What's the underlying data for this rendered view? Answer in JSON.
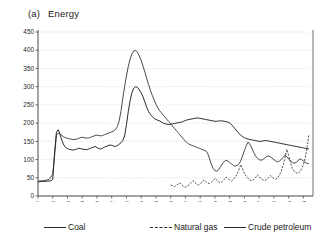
{
  "panel": {
    "tag": "(a)",
    "title": "Energy"
  },
  "legend": {
    "position": "bottom",
    "items": [
      {
        "label": "Coal",
        "style": "solid",
        "key": "coal"
      },
      {
        "label": "Natural gas",
        "style": "dashed",
        "key": "natural_gas"
      },
      {
        "label": "Crude petroleum",
        "style": "solid",
        "key": "crude_petroleum"
      }
    ]
  },
  "axes": {
    "y_ticks": [
      0,
      50,
      100,
      150,
      200,
      250,
      300,
      350,
      400,
      450
    ],
    "x_ticks": [
      1972,
      1974,
      1976,
      1978,
      1980,
      1982,
      1984,
      1986,
      1988,
      1990,
      1992,
      1994,
      1996,
      1998,
      2000,
      2002,
      2004,
      2006,
      2008
    ]
  },
  "colors": {
    "line": "#2b2b2b",
    "grid": "#b9b9b9",
    "axis": "#4a4a4a",
    "background": "#ffffff"
  },
  "chart_data": {
    "type": "line",
    "xlabel": "",
    "ylabel": "",
    "xlim": [
      1972,
      2008.9
    ],
    "ylim": [
      0,
      450
    ],
    "grid": true,
    "legend_position": "bottom",
    "x_tick_labels": [
      "1972",
      "1974",
      "1976",
      "1978",
      "1980",
      "1982",
      "1984",
      "1986",
      "1988",
      "1990",
      "1992",
      "1994",
      "1996",
      "1998",
      "2000",
      "2002",
      "2004",
      "2006",
      "2008"
    ],
    "y_tick_labels": [
      "0",
      "50",
      "100",
      "150",
      "200",
      "250",
      "300",
      "350",
      "400",
      "450"
    ],
    "series": [
      {
        "name": "Coal",
        "style": "solid",
        "x_start": 1972.0,
        "x_step": 0.25,
        "values": [
          39,
          39,
          40,
          40,
          40,
          41,
          41,
          42,
          45,
          120,
          175,
          182,
          168,
          152,
          140,
          133,
          130,
          128,
          127,
          126,
          127,
          129,
          131,
          130,
          129,
          128,
          127,
          128,
          130,
          132,
          134,
          136,
          133,
          130,
          129,
          131,
          134,
          136,
          138,
          140,
          139,
          137,
          136,
          138,
          142,
          146,
          152,
          165,
          196,
          232,
          262,
          284,
          296,
          300,
          298,
          291,
          283,
          272,
          258,
          243,
          232,
          224,
          218,
          213,
          210,
          208,
          206,
          203,
          200,
          198,
          197,
          196,
          197,
          198,
          199,
          200,
          201,
          202,
          203,
          205,
          207,
          209,
          210,
          211,
          212,
          213,
          214,
          214,
          213,
          212,
          211,
          210,
          209,
          208,
          207,
          206,
          205,
          205,
          206,
          206,
          206,
          205,
          204,
          203,
          200,
          196,
          190,
          184,
          178,
          172,
          167,
          163,
          160,
          158,
          156,
          155,
          154,
          153,
          152,
          151,
          150,
          150,
          151,
          152,
          152,
          151,
          150,
          149,
          148,
          147,
          146,
          145,
          144,
          143,
          142,
          141,
          140,
          139,
          138,
          137,
          136,
          135,
          134,
          133,
          132,
          131,
          130,
          129,
          128,
          127,
          126,
          125,
          124,
          124,
          125,
          127,
          130,
          134,
          139,
          145,
          152,
          158,
          163,
          167,
          170,
          172,
          173,
          174,
          175,
          177,
          180,
          186,
          196,
          212,
          235,
          268,
          300,
          330,
          352,
          368,
          380,
          392,
          404,
          418,
          432,
          444,
          451,
          455
        ]
      },
      {
        "name": "Natural gas",
        "style": "dashed",
        "x_start": 1990.0,
        "x_step": 0.25,
        "values": [
          30,
          28,
          26,
          29,
          33,
          36,
          30,
          26,
          24,
          27,
          31,
          36,
          42,
          38,
          33,
          30,
          33,
          38,
          44,
          40,
          36,
          34,
          37,
          42,
          48,
          44,
          39,
          36,
          40,
          45,
          52,
          48,
          44,
          41,
          45,
          52,
          60,
          72,
          86,
          74,
          62,
          54,
          48,
          44,
          42,
          45,
          50,
          58,
          54,
          48,
          44,
          42,
          45,
          50,
          56,
          52,
          48,
          46,
          50,
          58,
          68,
          84,
          104,
          128,
          112,
          92,
          76,
          68,
          64,
          62,
          66,
          74,
          86,
          104,
          132,
          168,
          140,
          112,
          92,
          80,
          74,
          72,
          78,
          90,
          104,
          122,
          140,
          126,
          112,
          100,
          92,
          88,
          92,
          104,
          124,
          152,
          178,
          205,
          230,
          252,
          268,
          278,
          286,
          295
        ]
      },
      {
        "name": "Crude petroleum",
        "style": "solid",
        "x_start": 1972.0,
        "x_step": 0.25,
        "values": [
          41,
          41,
          42,
          42,
          43,
          44,
          46,
          52,
          60,
          110,
          168,
          172,
          170,
          166,
          162,
          160,
          158,
          157,
          156,
          155,
          155,
          156,
          158,
          160,
          161,
          160,
          159,
          159,
          160,
          162,
          164,
          166,
          167,
          166,
          165,
          166,
          168,
          170,
          172,
          174,
          176,
          178,
          182,
          190,
          205,
          232,
          268,
          300,
          330,
          356,
          376,
          390,
          398,
          400,
          394,
          384,
          372,
          356,
          340,
          322,
          306,
          290,
          276,
          264,
          252,
          242,
          234,
          228,
          222,
          216,
          210,
          204,
          198,
          192,
          186,
          180,
          174,
          168,
          162,
          156,
          150,
          146,
          142,
          140,
          138,
          136,
          134,
          132,
          130,
          128,
          126,
          124,
          118,
          104,
          88,
          76,
          70,
          68,
          72,
          80,
          88,
          94,
          98,
          96,
          92,
          88,
          84,
          82,
          84,
          88,
          96,
          110,
          124,
          138,
          148,
          142,
          132,
          120,
          110,
          104,
          100,
          98,
          100,
          104,
          108,
          110,
          108,
          104,
          100,
          96,
          94,
          96,
          100,
          106,
          112,
          108,
          102,
          96,
          92,
          90,
          92,
          96,
          102,
          100,
          96,
          92,
          90,
          88,
          90,
          94,
          100,
          104,
          108,
          112,
          110,
          106,
          100,
          94,
          88,
          82,
          76,
          70,
          64,
          60,
          58,
          62,
          70,
          80,
          92,
          104,
          116,
          124,
          128,
          124,
          118,
          112,
          108,
          112,
          120,
          132,
          142,
          150,
          152,
          146,
          138,
          130,
          124,
          120,
          122,
          130,
          142,
          156,
          168,
          176,
          180,
          176,
          170,
          164,
          160,
          158,
          162,
          172,
          186,
          202,
          218,
          232,
          244,
          252,
          256,
          252,
          246,
          242,
          244,
          252,
          266,
          284,
          302,
          318,
          330,
          336,
          330,
          316,
          300,
          288,
          284,
          296,
          320,
          352,
          384,
          412,
          434,
          448,
          452,
          440,
          412,
          366
        ]
      }
    ]
  }
}
